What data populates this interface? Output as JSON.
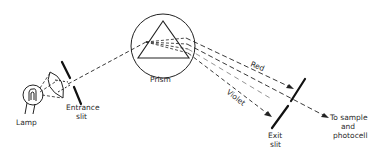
{
  "diagram": {
    "components": {
      "lamp": {
        "label": "Lamp"
      },
      "entrance_slit": {
        "label_line1": "Entrance",
        "label_line2": "slit"
      },
      "prism": {
        "label": "Prism"
      },
      "exit_slit": {
        "label_line1": "Exit",
        "label_line2": "slit"
      },
      "output": {
        "label_line1": "To sample",
        "label_line2": "and",
        "label_line3": "photocell"
      }
    },
    "rays": {
      "red": {
        "label": "Red"
      },
      "violet": {
        "label": "Violet"
      }
    },
    "colors": {
      "line": "#222222",
      "background": "#ffffff"
    }
  }
}
